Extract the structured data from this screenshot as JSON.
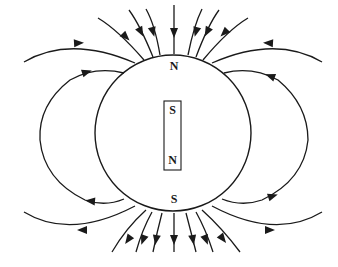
{
  "diagram": {
    "globe_labels": {
      "top": "N",
      "bottom": "S"
    },
    "bar_magnet": {
      "top_pole": "S",
      "bottom_pole": "N"
    },
    "field_direction": "lines enter at top pole (N), exit at bottom pole (S)",
    "line_color": "#1a1a1a",
    "background_color": "#ffffff",
    "counts": {
      "top_radial_lines": 7,
      "bottom_radial_lines": 7,
      "side_loops_per_side": 2
    }
  }
}
